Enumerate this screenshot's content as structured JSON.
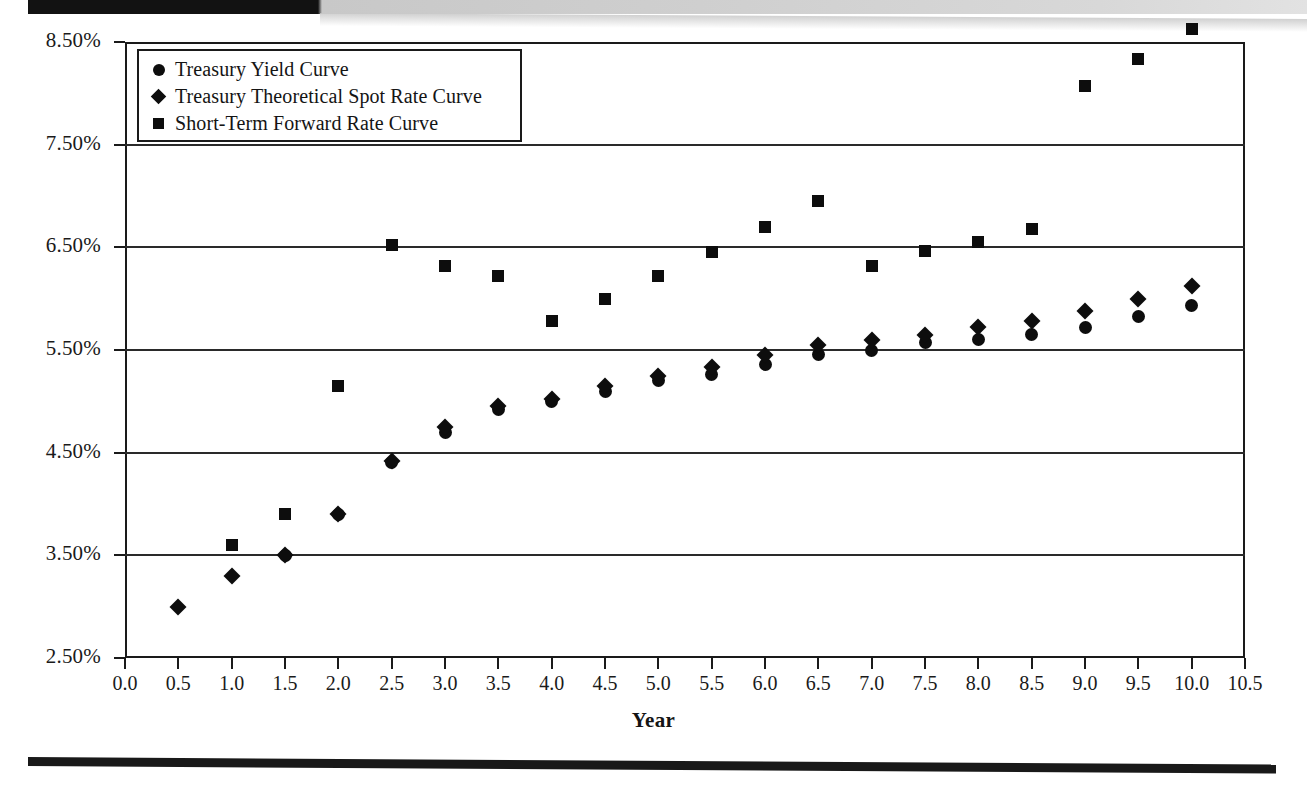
{
  "page": {
    "scan_artifacts": {
      "top_bar": "dark-scan-edge",
      "bottom_rule": "horizontal-rule"
    }
  },
  "chart_data": {
    "type": "scatter",
    "title": "",
    "xlabel": "Year",
    "ylabel": "",
    "xlim": [
      0.0,
      10.5
    ],
    "ylim": [
      2.5,
      8.5
    ],
    "grid": true,
    "legend_position": "top-left",
    "x_ticks": [
      "0.0",
      "0.5",
      "1.0",
      "1.5",
      "2.0",
      "2.5",
      "3.0",
      "3.5",
      "4.0",
      "4.5",
      "5.0",
      "5.5",
      "6.0",
      "6.5",
      "7.0",
      "7.5",
      "8.0",
      "8.5",
      "9.0",
      "9.5",
      "10.0",
      "10.5"
    ],
    "x_tick_values": [
      0.0,
      0.5,
      1.0,
      1.5,
      2.0,
      2.5,
      3.0,
      3.5,
      4.0,
      4.5,
      5.0,
      5.5,
      6.0,
      6.5,
      7.0,
      7.5,
      8.0,
      8.5,
      9.0,
      9.5,
      10.0,
      10.5
    ],
    "y_ticks": [
      "2.50%",
      "3.50%",
      "4.50%",
      "5.50%",
      "6.50%",
      "7.50%",
      "8.50%"
    ],
    "y_tick_values": [
      2.5,
      3.5,
      4.5,
      5.5,
      6.5,
      7.5,
      8.5
    ],
    "series": [
      {
        "name": "Treasury Yield Curve",
        "marker": "circle",
        "x": [
          1.5,
          2.0,
          2.5,
          3.0,
          3.5,
          4.0,
          4.5,
          5.0,
          5.5,
          6.0,
          6.5,
          7.0,
          7.5,
          8.0,
          8.5,
          9.0,
          9.5,
          10.0
        ],
        "values": [
          3.5,
          3.9,
          4.4,
          4.7,
          4.92,
          5.0,
          5.1,
          5.2,
          5.26,
          5.36,
          5.46,
          5.5,
          5.57,
          5.6,
          5.65,
          5.72,
          5.83,
          5.93
        ]
      },
      {
        "name": "Treasury Theoretical Spot Rate Curve",
        "marker": "diamond",
        "x": [
          0.5,
          1.0,
          1.5,
          2.0,
          2.5,
          3.0,
          3.5,
          4.0,
          4.5,
          5.0,
          5.5,
          6.0,
          6.5,
          7.0,
          7.5,
          8.0,
          8.5,
          9.0,
          9.5,
          10.0
        ],
        "values": [
          3.0,
          3.3,
          3.5,
          3.9,
          4.42,
          4.75,
          4.95,
          5.02,
          5.15,
          5.25,
          5.33,
          5.45,
          5.55,
          5.6,
          5.65,
          5.72,
          5.78,
          5.88,
          6.0,
          6.12
        ]
      },
      {
        "name": "Short-Term Forward Rate Curve",
        "marker": "square",
        "x": [
          1.0,
          1.5,
          2.0,
          2.5,
          3.0,
          3.5,
          4.0,
          4.5,
          5.0,
          5.5,
          6.0,
          6.5,
          7.0,
          7.5,
          8.0,
          8.5,
          9.0,
          9.5,
          10.0
        ],
        "values": [
          3.6,
          3.9,
          5.15,
          6.52,
          6.32,
          6.22,
          5.78,
          6.0,
          6.22,
          6.45,
          6.7,
          6.95,
          6.32,
          6.46,
          6.55,
          6.68,
          8.07,
          8.33,
          8.63
        ]
      }
    ]
  },
  "legend": {
    "items": [
      {
        "marker": "circle",
        "label": "Treasury Yield Curve"
      },
      {
        "marker": "diamond",
        "label": "Treasury Theoretical Spot Rate Curve"
      },
      {
        "marker": "square",
        "label": "Short-Term Forward Rate Curve"
      }
    ]
  },
  "axis": {
    "x_title": "Year"
  }
}
